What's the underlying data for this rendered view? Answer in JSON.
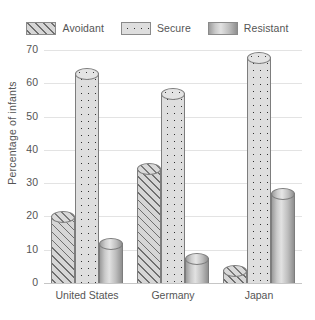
{
  "chart_data": {
    "type": "bar",
    "title": "",
    "xlabel": "",
    "ylabel": "Percentage of infants",
    "categories": [
      "United States",
      "Germany",
      "Japan"
    ],
    "series": [
      {
        "name": "Avoidant",
        "values": [
          20,
          34.5,
          4
        ]
      },
      {
        "name": "Secure",
        "values": [
          63,
          57,
          68
        ]
      },
      {
        "name": "Resistant",
        "values": [
          12,
          7.5,
          27
        ]
      }
    ],
    "ylim": [
      0,
      70
    ],
    "yticks": [
      0,
      10,
      20,
      30,
      40,
      50,
      60,
      70
    ],
    "ytick_labels": [
      "0",
      "10",
      "20",
      "30",
      "40",
      "50",
      "60",
      "70"
    ],
    "grid": true,
    "legend_position": "top",
    "legend": [
      {
        "label": "Avoidant",
        "pattern": "diagonal-hatch",
        "color": "#d6d6d6"
      },
      {
        "label": "Secure",
        "pattern": "dotted",
        "color": "#dedede"
      },
      {
        "label": "Resistant",
        "pattern": "solid-gradient",
        "color": "#bdbdbd"
      }
    ]
  },
  "legend": {
    "items": [
      {
        "label": "Avoidant"
      },
      {
        "label": "Secure"
      },
      {
        "label": "Resistant"
      }
    ]
  },
  "axes": {
    "y_title": "Percentage of infants",
    "y_ticks": [
      "70",
      "60",
      "50",
      "40",
      "30",
      "20",
      "10",
      "0"
    ],
    "x_ticks": [
      "United States",
      "Germany",
      "Japan"
    ]
  }
}
